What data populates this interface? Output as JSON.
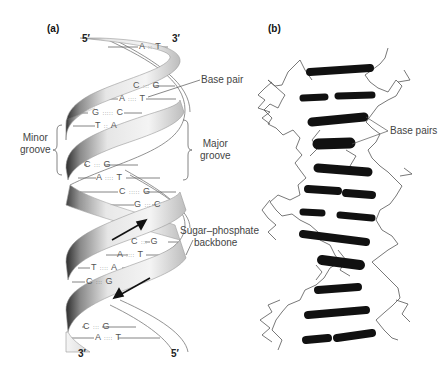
{
  "figure": {
    "panels": [
      {
        "id": "a",
        "label": "(a)",
        "ends": {
          "top_left": "5′",
          "top_right": "3′",
          "bottom_left": "3′",
          "bottom_right": "5′"
        },
        "base_pairs": [
          {
            "text": "A=T",
            "left": "A",
            "right": "T",
            "bond": "::"
          },
          {
            "text": "C≡G",
            "left": "C",
            "right": "G",
            "bond": ":::"
          },
          {
            "text": "A=T",
            "left": "A",
            "right": "T",
            "bond": "::::"
          },
          {
            "text": "G≡C",
            "left": "G",
            "right": "C",
            "bond": ":::::"
          },
          {
            "text": "T=A",
            "left": "T",
            "right": "A",
            "bond": "::"
          },
          {
            "text": "C≡G",
            "left": "C",
            "right": "G",
            "bond": ":::"
          },
          {
            "text": "A=T",
            "left": "A",
            "right": "T",
            "bond": "::::"
          },
          {
            "text": "C≡G",
            "left": "C",
            "right": "G",
            "bond": ":::::"
          },
          {
            "text": "G≡C",
            "left": "G",
            "right": "C",
            "bond": ":::"
          },
          {
            "text": "C≡G",
            "left": "C",
            "right": "G",
            "bond": ":::"
          },
          {
            "text": "A=T",
            "left": "A",
            "right": "T",
            "bond": "::::"
          },
          {
            "text": "T=A",
            "left": "T",
            "right": "A",
            "bond": "::::"
          },
          {
            "text": "C≡G",
            "left": "C",
            "right": "G",
            "bond": ":::"
          },
          {
            "text": "C≡G",
            "left": "C",
            "right": "G",
            "bond": ":::"
          },
          {
            "text": "A=T",
            "left": "A",
            "right": "T",
            "bond": "::::"
          }
        ],
        "annotations": {
          "base_pair": "Base pair",
          "minor_groove": [
            "Minor",
            "groove"
          ],
          "major_groove": [
            "Major",
            "groove"
          ],
          "backbone": [
            "Sugar–phosphate",
            "backbone"
          ]
        }
      },
      {
        "id": "b",
        "label": "(b)",
        "annotations": {
          "base_pairs": "Base pairs"
        }
      }
    ],
    "colors": {
      "ribbon_light": "#f2f2f2",
      "ribbon_mid": "#bdbdbd",
      "ribbon_dark": "#3a3a3a",
      "base_bar": "#111111",
      "backbone_line": "#555555",
      "text": "#444444"
    }
  }
}
